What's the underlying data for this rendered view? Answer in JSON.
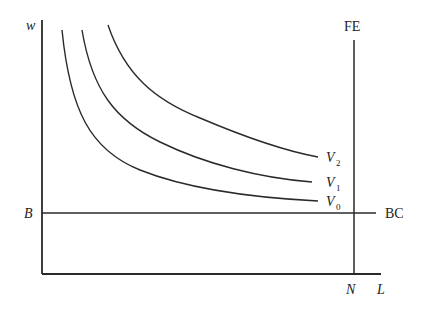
{
  "diagram": {
    "axis_labels": {
      "y": "w",
      "x": "L"
    },
    "lines": {
      "fe_label": "FE",
      "bc_label": "BC",
      "bc_level_label": "B",
      "fe_level_label": "N"
    },
    "curves": [
      {
        "name": "V",
        "subscript": "2"
      },
      {
        "name": "V",
        "subscript": "1"
      },
      {
        "name": "V",
        "subscript": "0"
      }
    ],
    "colors": {
      "line": "#2a2a2a",
      "background": "#ffffff"
    }
  }
}
